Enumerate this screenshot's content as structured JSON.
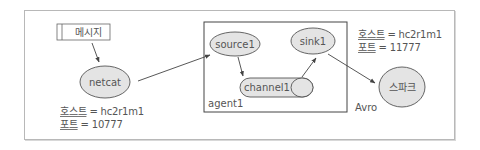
{
  "diagram": {
    "title": "",
    "message_box": {
      "label": "메시지"
    },
    "nodes": {
      "netcat": {
        "label": "netcat"
      },
      "source": {
        "label": "source1"
      },
      "sink": {
        "label": "sink1"
      },
      "channel": {
        "label": "channel1"
      },
      "spark": {
        "label": "스파크"
      }
    },
    "agent": {
      "label": "agent1"
    },
    "edge_labels": {
      "avro": "Avro"
    },
    "left_host": {
      "host_key": "호스트",
      "host_value": " = hc2r1m1",
      "port_key": "포트",
      "port_value": " = 10777"
    },
    "right_host": {
      "host_key": "호스트",
      "host_value": " = hc2r1m1",
      "port_key": "포트",
      "port_value": " = 11777"
    },
    "colors": {
      "node_fill": "#e4e4e4",
      "stroke": "#555555",
      "frame": "#b8b8b8"
    }
  }
}
